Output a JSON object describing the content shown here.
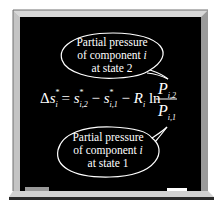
{
  "bubble_top": {
    "line1": "Partial pressure",
    "line2_prefix": "of component ",
    "line2_var": "i",
    "line3": "at state 2"
  },
  "bubble_bottom": {
    "line1": "Partial pressure",
    "line2_prefix": "of component ",
    "line2_var": "i",
    "line3": "at state 1"
  },
  "equation": {
    "delta": "Δ",
    "lhs_var": "s",
    "lhs_sub": "i",
    "lhs_sup": "*",
    "eq": " = ",
    "term1_var": "s",
    "term1_sup": "*",
    "term1_sub": "i,2",
    "minus1": " − ",
    "term2_var": "s",
    "term2_sup": "*",
    "term2_sub": "i,1",
    "minus2": " − ",
    "r_var": "R",
    "r_sub": "i",
    "ln": " ln",
    "num_var": "P",
    "num_sub": "i,2",
    "den_var": "P",
    "den_sub": "i,1"
  },
  "colors": {
    "board": "#000000",
    "frame_light": "#e4e4e4",
    "frame_dark": "#8a8a8a",
    "chalk": "#ffffff"
  }
}
